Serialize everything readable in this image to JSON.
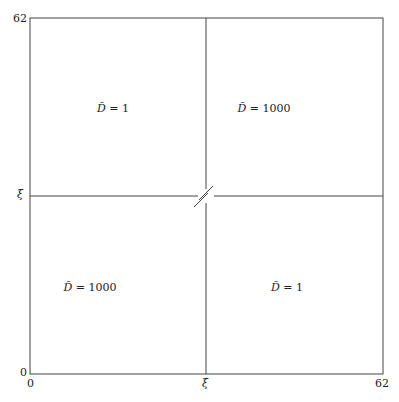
{
  "diagram": {
    "axes": {
      "y_ticks": [
        "62",
        "ξ",
        "0"
      ],
      "x_ticks": [
        "0",
        "ξ",
        "62"
      ]
    },
    "regions": [
      {
        "position": "top-left",
        "symbol": "D̃",
        "value": "= 1"
      },
      {
        "position": "top-right",
        "symbol": "D̃",
        "value": "= 1000"
      },
      {
        "position": "bottom-left",
        "symbol": "D̃",
        "value": "= 1000"
      },
      {
        "position": "bottom-right",
        "symbol": "D̃",
        "value": "= 1"
      }
    ],
    "colors": {
      "line": "#444444",
      "background": "#ffffff"
    }
  }
}
